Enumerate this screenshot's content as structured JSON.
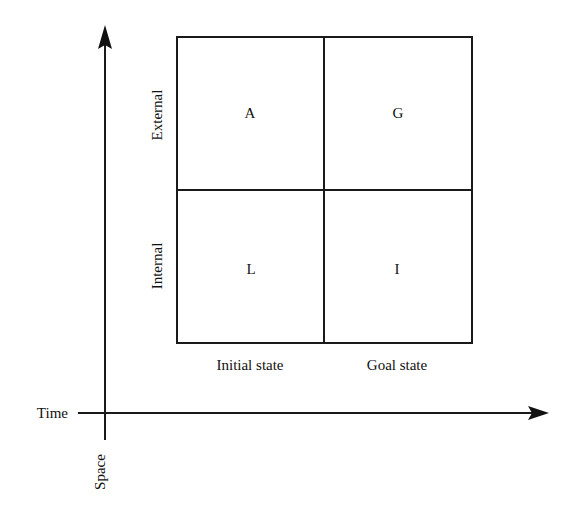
{
  "diagram": {
    "type": "2x2 matrix on time-space axes",
    "axes": {
      "horizontal_label": "Time",
      "vertical_label": "Space"
    },
    "row_labels": [
      "External",
      "Internal"
    ],
    "column_labels": [
      "Initial state",
      "Goal state"
    ],
    "cells": [
      {
        "row": "External",
        "column": "Initial state",
        "letter": "A"
      },
      {
        "row": "External",
        "column": "Goal state",
        "letter": "G"
      },
      {
        "row": "Internal",
        "column": "Initial state",
        "letter": "L"
      },
      {
        "row": "Internal",
        "column": "Goal state",
        "letter": "I"
      }
    ],
    "colors": {
      "stroke": "#1a1a1a",
      "background": "#ffffff"
    }
  }
}
